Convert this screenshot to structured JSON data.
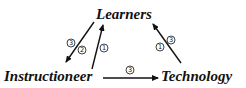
{
  "diagram": {
    "nodes": {
      "learners": "Learners",
      "instructioneer": "Instructioneer",
      "technology": "Technology"
    },
    "edges": [
      {
        "from": "learners",
        "to": "instructioneer",
        "badge": "3"
      },
      {
        "from": "learners",
        "to": "instructioneer",
        "badge": "2"
      },
      {
        "from": "instructioneer",
        "to": "learners",
        "badge": "1"
      },
      {
        "from": "technology",
        "to": "learners",
        "badges": [
          "1",
          "3"
        ]
      },
      {
        "from": "instructioneer",
        "to": "technology",
        "badge": "3"
      }
    ],
    "colors": {
      "ink": "#111111",
      "background": "#ffffff"
    }
  }
}
